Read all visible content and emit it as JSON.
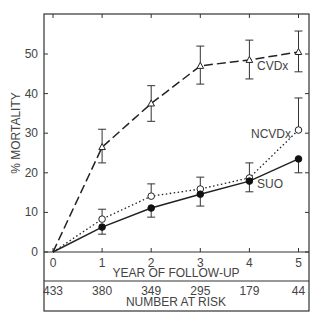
{
  "chart_data": {
    "type": "line",
    "title": "",
    "xlabel": "YEAR OF FOLLOW-UP",
    "ylabel": "% MORTALITY",
    "x": [
      0,
      1,
      2,
      3,
      4,
      5
    ],
    "xticks": [
      "0",
      "1",
      "2",
      "3",
      "4",
      "5"
    ],
    "yticks": [
      "0",
      "10",
      "20",
      "30",
      "40",
      "50"
    ],
    "ylim": [
      0,
      60
    ],
    "grid": false,
    "legend": "inline labels",
    "series": [
      {
        "name": "CVDx",
        "style": "dashed",
        "marker": "open-triangle",
        "values": [
          0,
          26.5,
          37.5,
          47,
          48.5,
          50.5
        ],
        "err_low": [
          0,
          22.5,
          33,
          42.4,
          43.7,
          45.5
        ],
        "err_high": [
          0,
          31,
          42,
          52,
          53.5,
          55.8
        ]
      },
      {
        "name": "NCVDx",
        "style": "dotted",
        "marker": "open-circle",
        "values": [
          0,
          8.3,
          14.1,
          15.9,
          18.7,
          30.8
        ],
        "err_low": [
          0,
          8.3,
          14.1,
          15.9,
          18.7,
          30.8
        ],
        "err_high": [
          0,
          10.8,
          17.2,
          18.9,
          22.5,
          38.9
        ]
      },
      {
        "name": "SUO",
        "style": "solid",
        "marker": "filled-circle",
        "values": [
          0,
          6.3,
          11.1,
          14.6,
          17.9,
          23.5
        ],
        "err_low": [
          0,
          4.5,
          8.8,
          11.6,
          15.2,
          20
        ],
        "err_high": [
          0,
          6.3,
          11.1,
          14.6,
          17.9,
          23.5
        ]
      }
    ],
    "number_at_risk": {
      "label": "NUMBER AT RISK",
      "values": [
        "433",
        "380",
        "349",
        "295",
        "179",
        "44"
      ]
    }
  }
}
